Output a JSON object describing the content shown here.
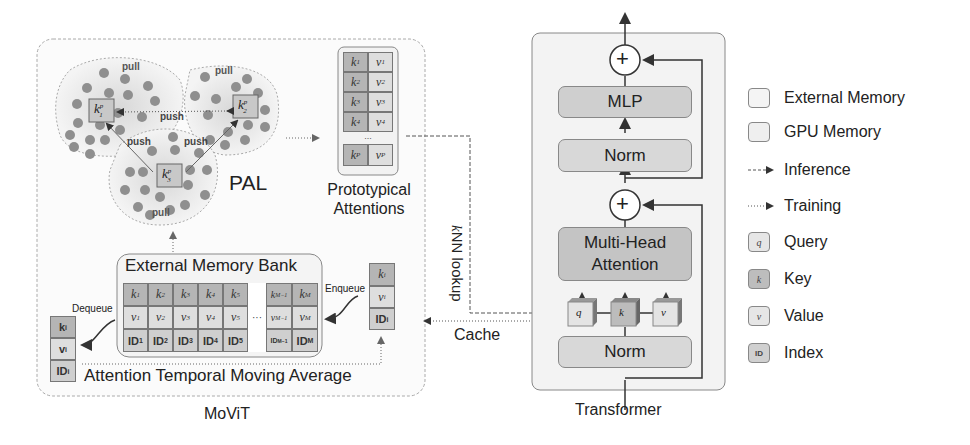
{
  "movit": {
    "caption": "MoViT",
    "pal": {
      "label": "PAL",
      "pull_labels": [
        "pull",
        "pull",
        "pull"
      ],
      "push_labels": [
        "push",
        "push",
        "push"
      ],
      "prototypes": [
        "k",
        "k",
        "k"
      ],
      "prototype_sup": "p",
      "prototype_sub": [
        "1",
        "2",
        "3"
      ]
    },
    "prototypical_attentions": {
      "title_line1": "Prototypical",
      "title_line2": "Attentions",
      "rows": [
        {
          "k": "k",
          "k_sub": "1",
          "v": "v",
          "v_sub": "1"
        },
        {
          "k": "k",
          "k_sub": "2",
          "v": "v",
          "v_sub": "2"
        },
        {
          "k": "k",
          "k_sub": "3",
          "v": "v",
          "v_sub": "3"
        },
        {
          "k": "k",
          "k_sub": "4",
          "v": "v",
          "v_sub": "4"
        },
        {
          "k": "k",
          "k_sub": "P",
          "v": "v",
          "v_sub": "P"
        }
      ],
      "ellipsis": "..."
    },
    "memory_bank": {
      "title": "External Memory Bank",
      "columns": [
        {
          "k": "k",
          "k_sub": "1",
          "v": "v",
          "v_sub": "1",
          "id": "ID",
          "id_sub": "1"
        },
        {
          "k": "k",
          "k_sub": "2",
          "v": "v",
          "v_sub": "2",
          "id": "ID",
          "id_sub": "2"
        },
        {
          "k": "k",
          "k_sub": "3",
          "v": "v",
          "v_sub": "3",
          "id": "ID",
          "id_sub": "3"
        },
        {
          "k": "k",
          "k_sub": "4",
          "v": "v",
          "v_sub": "4",
          "id": "ID",
          "id_sub": "4"
        },
        {
          "k": "k",
          "k_sub": "5",
          "v": "v",
          "v_sub": "5",
          "id": "ID",
          "id_sub": "5"
        },
        {
          "k": "k",
          "k_sub": "M−1",
          "v": "v",
          "v_sub": "M−1",
          "id": "ID",
          "id_sub": "M−1"
        },
        {
          "k": "k",
          "k_sub": "M",
          "v": "v",
          "v_sub": "M",
          "id": "ID",
          "id_sub": "M"
        }
      ],
      "ellipsis": "···"
    },
    "dequeue_label": "Dequeue",
    "enqueue_label": "Enqueue",
    "dequeued_item": {
      "k": "k",
      "k_sub": "i",
      "v": "v",
      "v_sub": "i",
      "id": "ID",
      "id_sub": "i"
    },
    "enqueued_item": {
      "k": "k",
      "k_sub": "i",
      "v": "v",
      "v_sub": "i",
      "id": "ID",
      "id_sub": "i"
    },
    "atma_label": "Attention Temporal Moving Average"
  },
  "connectors": {
    "knn_lookup": "kNN lookup",
    "knn_k": "k",
    "knn_rest": "NN lookup",
    "cache": "Cache"
  },
  "transformer": {
    "caption": "Transformer",
    "mlp": "MLP",
    "norm_top": "Norm",
    "attention_line1": "Multi-Head",
    "attention_line2": "Attention",
    "norm_bottom": "Norm",
    "qkv": [
      "q",
      "k",
      "v"
    ],
    "plus": "+"
  },
  "legend": {
    "items": [
      {
        "label": "External Memory",
        "type": "swatch-external"
      },
      {
        "label": "GPU Memory",
        "type": "swatch-gpu"
      },
      {
        "label": "Inference",
        "type": "dashed-arrow"
      },
      {
        "label": "Training",
        "type": "dotted-arrow"
      },
      {
        "label": "Query",
        "type": "swatch-q",
        "glyph": "q"
      },
      {
        "label": "Key",
        "type": "swatch-k",
        "glyph": "k"
      },
      {
        "label": "Value",
        "type": "swatch-v",
        "glyph": "v"
      },
      {
        "label": "Index",
        "type": "swatch-id",
        "glyph": "ID"
      }
    ]
  },
  "colors": {
    "key_fill": "#b5b5b5",
    "value_fill": "#dedede",
    "id_fill": "#cfcfcf",
    "block_fill": "#d4d4d4",
    "attention_fill": "#c4c4c4",
    "cluster_dot": "#8f8f8f",
    "line": "#333333"
  }
}
